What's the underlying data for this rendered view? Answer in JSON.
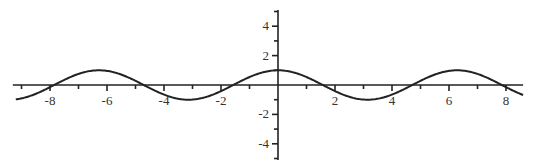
{
  "chart_data": {
    "type": "line",
    "title": "",
    "xlabel": "",
    "ylabel": "",
    "function": "cos(x)",
    "xlim": [
      -9.2,
      8.6
    ],
    "ylim": [
      -5.1,
      5.1
    ],
    "grid": false,
    "legend": "none",
    "x_ticks_major": [
      -8,
      -6,
      -4,
      -2,
      2,
      4,
      6,
      8
    ],
    "x_tick_labels": [
      "-8",
      "-6",
      "-4",
      "-2",
      "2",
      "4",
      "6",
      "8"
    ],
    "x_ticks_minor": [
      -9,
      -7,
      -5,
      -3,
      -1,
      1,
      3,
      5,
      7
    ],
    "y_ticks_major": [
      -4,
      -2,
      2,
      4
    ],
    "y_tick_labels": [
      "-4",
      "-2",
      "2",
      "4"
    ],
    "y_ticks_minor": [
      -5,
      -3,
      -1,
      1,
      3,
      5
    ],
    "series": [
      {
        "name": "cos(x)",
        "x": [
          -9.2,
          -8,
          -7.854,
          -6.283,
          -4.712,
          -3.142,
          -1.571,
          0,
          1.571,
          3.142,
          4.712,
          6.283,
          7.854,
          8,
          8.6
        ],
        "values": [
          -0.975,
          -0.146,
          0,
          1,
          0,
          -1,
          0,
          1,
          0,
          -1,
          0,
          1,
          0,
          -0.146,
          -0.672
        ]
      }
    ],
    "colors": {
      "curve": "#222222",
      "axes": "#222222"
    }
  }
}
